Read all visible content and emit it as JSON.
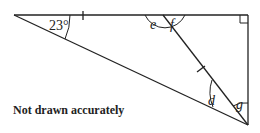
{
  "diagram": {
    "note": "Not drawn accurately",
    "angle_labels": {
      "given": "23°",
      "e": "e",
      "f": "f",
      "d": "d",
      "g": "g"
    },
    "colors": {
      "stroke": "#222222",
      "background": "#ffffff"
    }
  }
}
